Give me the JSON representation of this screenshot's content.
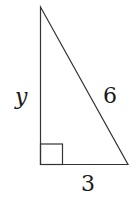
{
  "diagram": {
    "type": "right-triangle",
    "labels": {
      "vertical_leg": "y",
      "hypotenuse": "6",
      "horizontal_leg": "3"
    },
    "right_angle_marker": true,
    "colors": {
      "stroke": "#333333",
      "text": "#1a1a1a",
      "background": "#ffffff"
    }
  }
}
